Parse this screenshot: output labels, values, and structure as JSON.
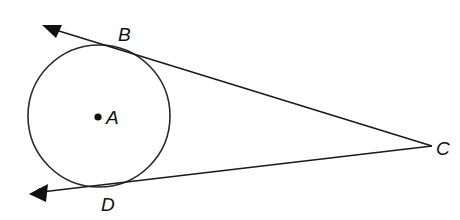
{
  "diagram": {
    "type": "geometry-tangents",
    "stroke_color": "#222222",
    "background": "#ffffff",
    "circle": {
      "center_label": "A",
      "cx": 99,
      "cy": 116,
      "r": 71
    },
    "points": [
      {
        "label": "A",
        "x": 99,
        "y": 116,
        "role": "center"
      },
      {
        "label": "B",
        "x": 117,
        "y": 46,
        "role": "point-of-tangency"
      },
      {
        "label": "C",
        "x": 432,
        "y": 146,
        "role": "external-vertex"
      },
      {
        "label": "D",
        "x": 108,
        "y": 186,
        "role": "point-of-tangency"
      }
    ],
    "rays": [
      {
        "name": "ray CB",
        "from": "C",
        "through": "B",
        "arrow_tip": [
          44,
          26
        ]
      },
      {
        "name": "ray CD",
        "from": "C",
        "through": "D",
        "arrow_tip": [
          30,
          194
        ]
      }
    ],
    "labels": {
      "A": "A",
      "B": "B",
      "C": "C",
      "D": "D"
    }
  }
}
